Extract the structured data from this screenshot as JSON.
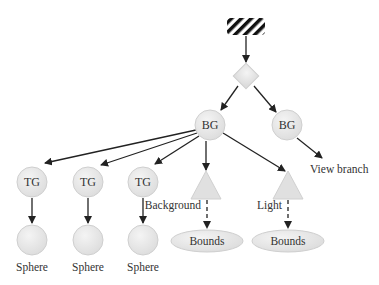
{
  "diagram": {
    "root": {
      "label": "",
      "shape": "hatched-locale"
    },
    "group": {
      "label": "",
      "shape": "diamond"
    },
    "branch_groups": [
      {
        "label": "BG"
      },
      {
        "label": "BG"
      }
    ],
    "view_branch_label": "View branch",
    "transform_groups": [
      {
        "label": "TG",
        "child_label": "Sphere"
      },
      {
        "label": "TG",
        "child_label": "Sphere"
      },
      {
        "label": "TG",
        "child_label": "Sphere"
      }
    ],
    "leaves": [
      {
        "label": "Background",
        "bounds_label": "Bounds"
      },
      {
        "label": "Light",
        "bounds_label": "Bounds"
      }
    ],
    "colors": {
      "node_fill": "#e6e6e6",
      "node_edge": "#cccccc",
      "arrow": "#222222",
      "text": "#333333"
    }
  }
}
